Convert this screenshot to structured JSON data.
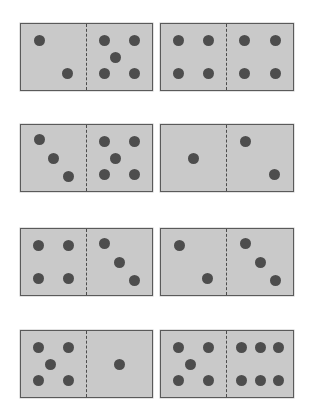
{
  "scene": {
    "title": "Domino tiles",
    "tile_count": 8,
    "columns": 2,
    "rows": 4,
    "colors": {
      "background": "#ffffff",
      "tile_fill": "#c9c9c9",
      "tile_border": "#5a5a5a",
      "divider": "#4c4c4c",
      "pip": "#4d4d4d"
    }
  },
  "pip_layouts": {
    "1": [
      [
        50,
        50
      ]
    ],
    "2": [
      [
        28,
        25
      ],
      [
        72,
        75
      ]
    ],
    "3": [
      [
        28,
        22
      ],
      [
        50,
        50
      ],
      [
        74,
        78
      ]
    ],
    "4": [
      [
        27,
        25
      ],
      [
        73,
        25
      ],
      [
        27,
        75
      ],
      [
        73,
        75
      ]
    ],
    "5": [
      [
        27,
        25
      ],
      [
        73,
        25
      ],
      [
        45,
        50
      ],
      [
        27,
        75
      ],
      [
        73,
        75
      ]
    ],
    "6": [
      [
        22,
        25
      ],
      [
        50,
        25
      ],
      [
        78,
        25
      ],
      [
        22,
        75
      ],
      [
        50,
        75
      ],
      [
        78,
        75
      ]
    ]
  },
  "dominoes": [
    {
      "id": "domino-1",
      "row": 1,
      "column": "left",
      "left_pips": 2,
      "right_pips": 5,
      "label": "2 | 5",
      "total": 7
    },
    {
      "id": "domino-2",
      "row": 1,
      "column": "right",
      "left_pips": 4,
      "right_pips": 4,
      "label": "4 | 4",
      "total": 8
    },
    {
      "id": "domino-3",
      "row": 2,
      "column": "left",
      "left_pips": 3,
      "right_pips": 5,
      "label": "3 | 5",
      "total": 8
    },
    {
      "id": "domino-4",
      "row": 2,
      "column": "right",
      "left_pips": 1,
      "right_pips": 2,
      "label": "1 | 2",
      "total": 3
    },
    {
      "id": "domino-5",
      "row": 3,
      "column": "left",
      "left_pips": 4,
      "right_pips": 3,
      "label": "4 | 3",
      "total": 7
    },
    {
      "id": "domino-6",
      "row": 3,
      "column": "right",
      "left_pips": 2,
      "right_pips": 3,
      "label": "2 | 3",
      "total": 5
    },
    {
      "id": "domino-7",
      "row": 4,
      "column": "left",
      "left_pips": 5,
      "right_pips": 1,
      "label": "5 | 1",
      "total": 6
    },
    {
      "id": "domino-8",
      "row": 4,
      "column": "right",
      "left_pips": 5,
      "right_pips": 6,
      "label": "5 | 6",
      "total": 11
    }
  ]
}
